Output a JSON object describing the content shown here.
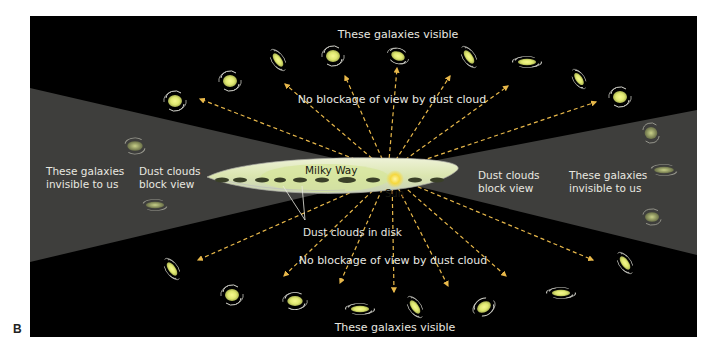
{
  "figure": {
    "panel_label": "B",
    "colors": {
      "background": "#000000",
      "dust_cone": "#3e3e3c",
      "arrow": "#e8b84a",
      "galaxy_core": "#e6ee80",
      "galaxy_ring": "#d8d8d0",
      "milky_way_disk": "#dfe8c0",
      "sun": "#f5d840",
      "label_text": "#e8e8e0"
    },
    "labels": {
      "top_visible": "These galaxies visible",
      "bottom_visible": "These galaxies visible",
      "top_no_blockage": "No blockage of view by dust cloud",
      "bottom_no_blockage": "No blockage of view by dust cloud",
      "left_invisible_line1": "These galaxies",
      "left_invisible_line2": "invisible to us",
      "right_invisible_line1": "These galaxies",
      "right_invisible_line2": "invisible to us",
      "left_dust_line1": "Dust clouds",
      "left_dust_line2": "block view",
      "right_dust_line1": "Dust clouds",
      "right_dust_line2": "block view",
      "milky_way": "Milky Way",
      "sun": "Sun",
      "dust_in_disk": "Dust clouds in disk"
    }
  }
}
